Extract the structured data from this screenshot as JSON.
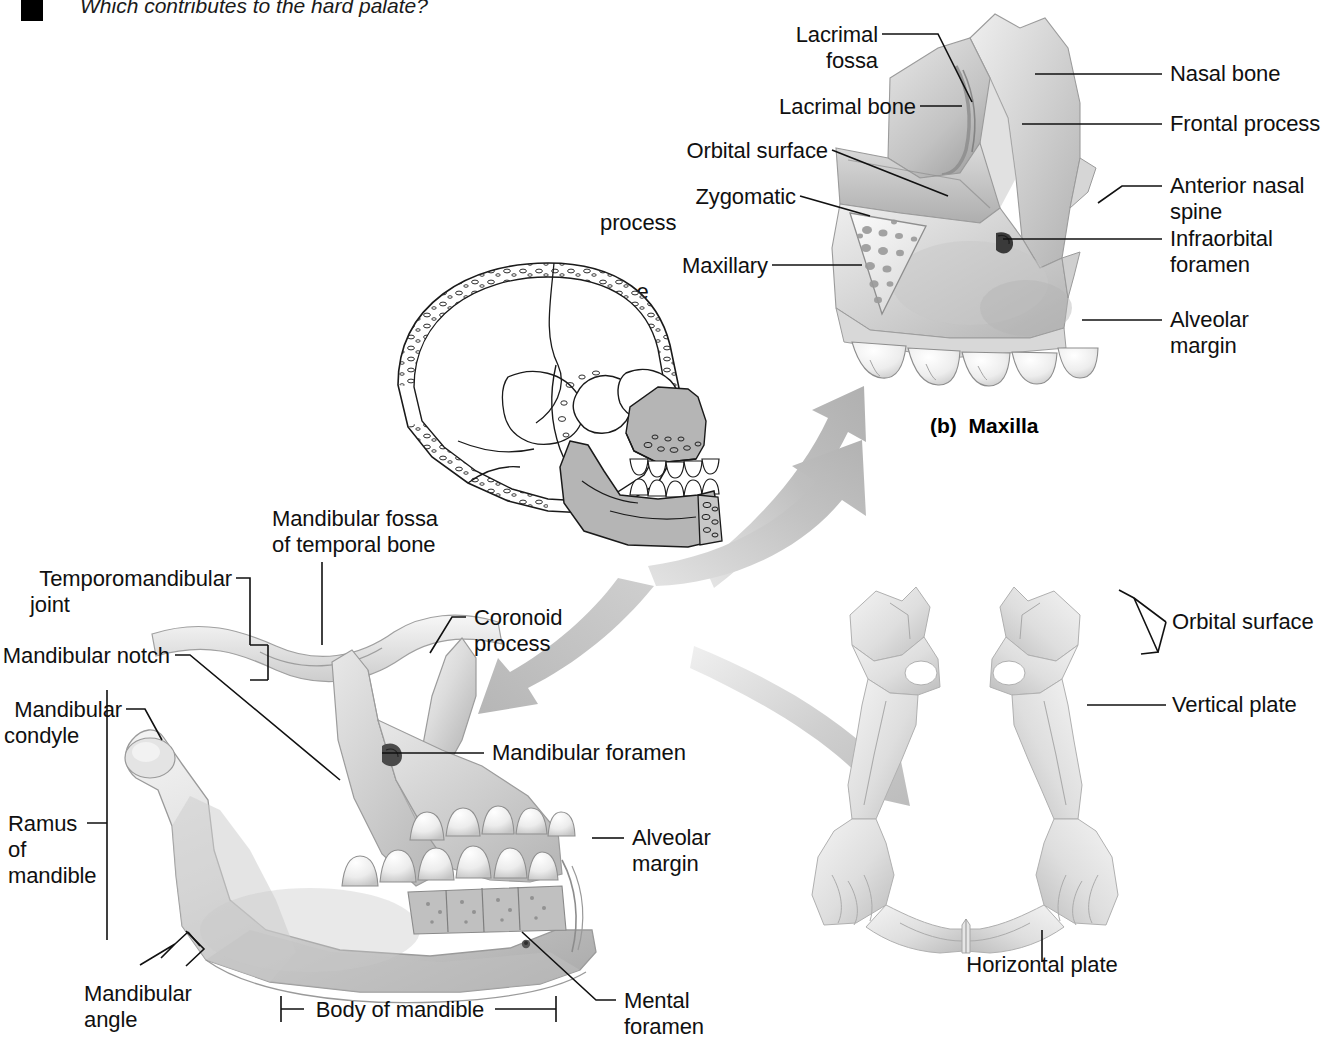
{
  "page": {
    "width": 1328,
    "height": 1064,
    "background": "#ffffff",
    "ink": "#101010"
  },
  "header": {
    "bullet_icon": "black-square-bullet",
    "question_text": "Which contributes to the hard palate?"
  },
  "figures": [
    {
      "id": "maxilla",
      "caption": "(b)  Maxilla",
      "caption_label": "(b)",
      "caption_name": "Maxilla"
    },
    {
      "id": "skull-sagittal",
      "caption": ""
    },
    {
      "id": "mandible",
      "caption": ""
    },
    {
      "id": "palatine",
      "caption": ""
    }
  ],
  "maxilla_labels": {
    "left": [
      {
        "text": "Lacrimal\nfossa",
        "lines": [
          "Lacrimal",
          "fossa"
        ]
      },
      {
        "text": "Lacrimal bone",
        "lines": [
          "Lacrimal bone"
        ]
      },
      {
        "text": "Orbital surface",
        "lines": [
          "Orbital surface"
        ]
      },
      {
        "text": "Zygomatic\nprocess",
        "lines": [
          "Zygomatic",
          "process"
        ]
      },
      {
        "text": "Maxillary\nbone",
        "lines": [
          "Maxillary",
          "bone"
        ]
      }
    ],
    "right": [
      {
        "text": "Nasal bone",
        "lines": [
          "Nasal bone"
        ]
      },
      {
        "text": "Frontal process",
        "lines": [
          "Frontal process"
        ]
      },
      {
        "text": "Anterior nasal\nspine",
        "lines": [
          "Anterior nasal",
          "spine"
        ]
      },
      {
        "text": "Infraorbital\nforamen",
        "lines": [
          "Infraorbital",
          "foramen"
        ]
      },
      {
        "text": "Alveolar\nmargin",
        "lines": [
          "Alveolar",
          "margin"
        ]
      }
    ]
  },
  "mandible_labels": {
    "left": [
      {
        "text": "Temporomandibular\njoint",
        "lines": [
          "Temporomandibular",
          "joint"
        ]
      },
      {
        "text": "Mandibular notch",
        "lines": [
          "Mandibular notch"
        ]
      },
      {
        "text": "Mandibular\ncondyle",
        "lines": [
          "Mandibular",
          "condyle"
        ]
      },
      {
        "text": "Ramus\nof\nmandible",
        "lines": [
          "Ramus",
          "of",
          "mandible"
        ]
      },
      {
        "text": "Mandibular\nangle",
        "lines": [
          "Mandibular",
          "angle"
        ]
      }
    ],
    "top": [
      {
        "text": "Mandibular fossa\nof temporal bone",
        "lines": [
          "Mandibular fossa",
          "of temporal bone"
        ]
      },
      {
        "text": "Coronoid\nprocess",
        "lines": [
          "Coronoid",
          "process"
        ]
      }
    ],
    "right": [
      {
        "text": "Mandibular foramen",
        "lines": [
          "Mandibular foramen"
        ]
      },
      {
        "text": "Alveolar\nmargin",
        "lines": [
          "Alveolar",
          "margin"
        ]
      },
      {
        "text": "Mental\nforamen",
        "lines": [
          "Mental",
          "foramen"
        ]
      }
    ],
    "bottom": [
      {
        "text": "Body of mandible",
        "lines": [
          "Body of mandible"
        ]
      }
    ]
  },
  "palatine_labels": {
    "right": [
      {
        "text": "Orbital surface",
        "lines": [
          "Orbital surface"
        ]
      },
      {
        "text": "Vertical plate",
        "lines": [
          "Vertical plate"
        ]
      }
    ],
    "bottom": [
      {
        "text": "Horizontal plate",
        "lines": [
          "Horizontal plate"
        ]
      }
    ]
  },
  "colors": {
    "bone_light": "#e9e9e9",
    "bone_mid": "#cfcfcf",
    "bone_dark": "#a8a8a8",
    "bone_shadow": "#8a8a8a",
    "arrow_gray": "#bdbdbd",
    "arrow_gray_light": "#d6d6d6",
    "skull_shade": "#b8b8b8",
    "leader_line": "#111111",
    "text": "#101010"
  }
}
